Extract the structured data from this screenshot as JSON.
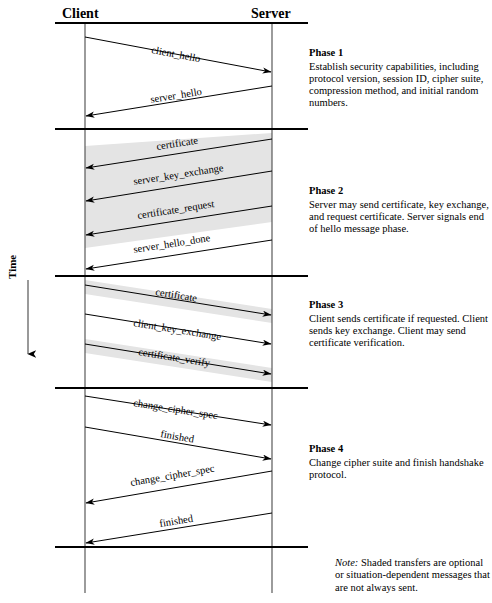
{
  "colors": {
    "line": "#000000",
    "shade": "#e2e2e2",
    "text": "#000000"
  },
  "parties": {
    "client": "Client",
    "server": "Server"
  },
  "time_axis": {
    "label": "Time",
    "direction": "down"
  },
  "phases": [
    {
      "id": "phase-1",
      "title": "Phase 1",
      "description": "Establish security capabilities, including protocol version, session ID, cipher suite, compression method, and initial random numbers.",
      "messages": [
        {
          "label": "client_hello",
          "direction": "client-to-server",
          "shaded": false
        },
        {
          "label": "server_hello",
          "direction": "server-to-client",
          "shaded": false
        }
      ]
    },
    {
      "id": "phase-2",
      "title": "Phase 2",
      "description": "Server may send certificate, key exchange, and request certificate. Server signals end of hello message phase.",
      "messages": [
        {
          "label": "certificate",
          "direction": "server-to-client",
          "shaded": true
        },
        {
          "label": "server_key_exchange",
          "direction": "server-to-client",
          "shaded": true
        },
        {
          "label": "certificate_request",
          "direction": "server-to-client",
          "shaded": true
        },
        {
          "label": "server_hello_done",
          "direction": "server-to-client",
          "shaded": false
        }
      ]
    },
    {
      "id": "phase-3",
      "title": "Phase 3",
      "description": "Client sends certificate if requested. Client sends key exchange. Client may send certificate verification.",
      "messages": [
        {
          "label": "certificate",
          "direction": "client-to-server",
          "shaded": true
        },
        {
          "label": "client_key_exchange",
          "direction": "client-to-server",
          "shaded": false
        },
        {
          "label": "certificate_verify",
          "direction": "client-to-server",
          "shaded": true
        }
      ]
    },
    {
      "id": "phase-4",
      "title": "Phase 4",
      "description": "Change cipher suite and finish handshake protocol.",
      "messages": [
        {
          "label": "change_cipher_spec",
          "direction": "client-to-server",
          "shaded": false
        },
        {
          "label": "finished",
          "direction": "client-to-server",
          "shaded": false
        },
        {
          "label": "change_cipher_spec",
          "direction": "server-to-client",
          "shaded": false
        },
        {
          "label": "finished",
          "direction": "server-to-client",
          "shaded": false
        }
      ]
    }
  ],
  "note": {
    "lead": "Note:",
    "text": " Shaded transfers are optional or situation-dependent messages that are not always sent."
  }
}
